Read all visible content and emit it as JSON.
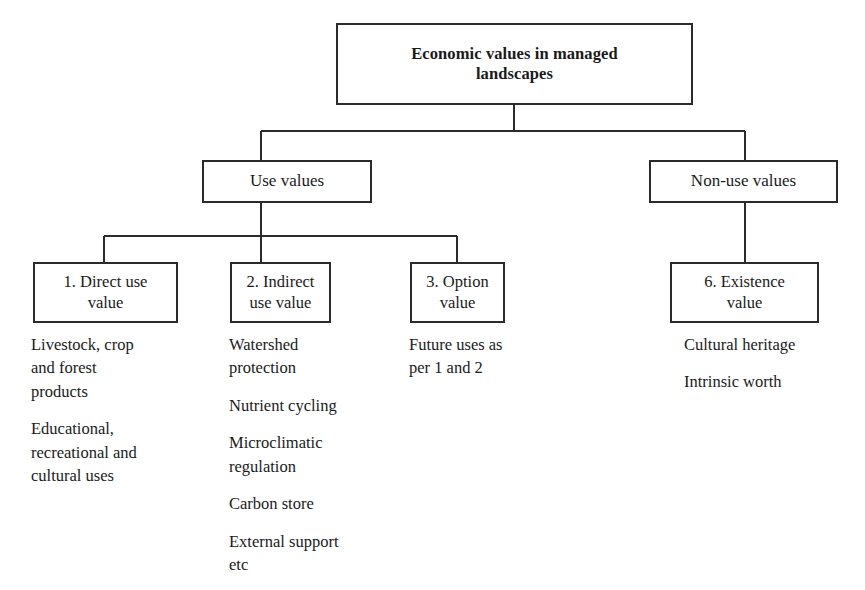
{
  "diagram": {
    "type": "hierarchy-tree",
    "title_node": {
      "label": "Economic values in managed\nlandscapes"
    },
    "branches": [
      {
        "label": "Use values"
      },
      {
        "label": "Non-use values"
      }
    ],
    "leaves": [
      {
        "label": "1. Direct use\nvalue"
      },
      {
        "label": "2. Indirect\nuse value"
      },
      {
        "label": "3. Option\nvalue"
      },
      {
        "label": "6. Existence\nvalue"
      }
    ],
    "notes": [
      {
        "column": "direct-use-value",
        "items": [
          "Livestock, crop\nand forest\nproducts",
          "Educational,\nrecreational and\ncultural uses"
        ]
      },
      {
        "column": "indirect-use-value",
        "items": [
          "Watershed\nprotection",
          "Nutrient cycling",
          "Microclimatic\nregulation",
          "Carbon store",
          "External support\netc"
        ]
      },
      {
        "column": "option-value",
        "items": [
          "Future uses as\nper 1 and 2"
        ]
      },
      {
        "column": "existence-value",
        "items": [
          "Cultural heritage",
          "Intrinsic worth"
        ]
      }
    ],
    "colors": {
      "line": "#2b2b2b",
      "text": "#1a1a1a",
      "background": "#ffffff"
    }
  }
}
